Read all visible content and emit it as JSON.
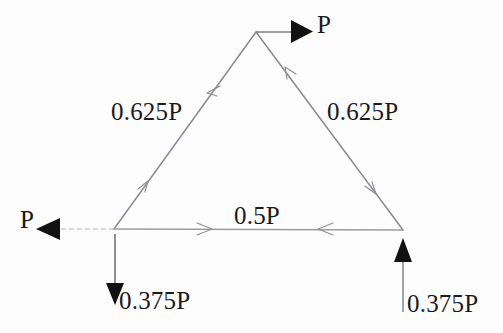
{
  "figure": {
    "type": "truss-free-body-diagram",
    "colors": {
      "background": "#fdfdfd",
      "member_line": "#8a8a92",
      "faint_line": "#a9a9b0",
      "solid_arrow": "#111111",
      "text": "#1a1a1a"
    },
    "nodes": {
      "apex": {
        "x": 256,
        "y": 32
      },
      "bottom_left": {
        "x": 114,
        "y": 229
      },
      "bottom_right": {
        "x": 403,
        "y": 230
      }
    },
    "members": [
      {
        "name": "left-member",
        "from": "bottom_left",
        "to": "apex",
        "force": "0.625P"
      },
      {
        "name": "right-member",
        "from": "apex",
        "to": "bottom_right",
        "force": "0.625P"
      },
      {
        "name": "bottom-chord",
        "from": "bottom_left",
        "to": "bottom_right",
        "force": "0.5P"
      }
    ],
    "labels": {
      "member_left_force": "0.625P",
      "member_right_force": "0.625P",
      "bottom_chord_force": "0.5P",
      "load_apex": "P",
      "load_left": "P",
      "reaction_left": "0.375P",
      "reaction_right": "0.375P"
    },
    "applied_loads": [
      {
        "name": "apex-load",
        "label": "P",
        "at": "apex",
        "direction": "right"
      },
      {
        "name": "left-load",
        "label": "P",
        "at": "bottom_left",
        "direction": "left"
      }
    ],
    "reactions": [
      {
        "name": "left-reaction",
        "label": "0.375P",
        "at": "bottom_left",
        "direction": "down"
      },
      {
        "name": "right-reaction",
        "label": "0.375P",
        "at": "bottom_right",
        "direction": "up"
      }
    ],
    "member_force_arrows": [
      {
        "name": "left-member-upper-arrow",
        "direction": "down-left",
        "at": {
          "x": 212,
          "y": 88
        }
      },
      {
        "name": "left-member-lower-arrow",
        "direction": "up-right",
        "at": {
          "x": 143,
          "y": 187
        }
      },
      {
        "name": "right-member-upper-arrow",
        "direction": "up-left",
        "at": {
          "x": 290,
          "y": 73
        }
      },
      {
        "name": "right-member-lower-arrow",
        "direction": "down-right",
        "at": {
          "x": 370,
          "y": 188
        }
      },
      {
        "name": "bottom-chord-left-arrow",
        "direction": "right",
        "at": {
          "x": 205,
          "y": 229
        }
      },
      {
        "name": "bottom-chord-right-arrow",
        "direction": "left",
        "at": {
          "x": 325,
          "y": 229
        }
      }
    ]
  }
}
